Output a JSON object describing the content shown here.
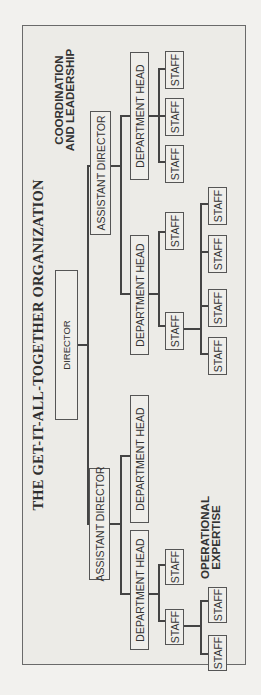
{
  "chart": {
    "title": "THE GET-IT-ALL-TOGETHER ORGANIZATION",
    "director": "DIRECTOR",
    "left_branch": {
      "assistant_director": "ASSISTANT DIRECTOR",
      "department_heads": [
        "DEPARTMENT HEAD",
        "DEPARTMENT HEAD"
      ],
      "staff": [
        "STAFF",
        "STAFF",
        "STAFF",
        "STAFF"
      ],
      "annotation_line1": "OPERATIONAL",
      "annotation_line2": "EXPERTISE"
    },
    "right_branch": {
      "assistant_director": "ASSISTANT DIRECTOR",
      "department_heads": [
        "DEPARTMENT HEAD",
        "DEPARTMENT HEAD"
      ],
      "staff_under_head_1": [
        "STAFF",
        "STAFF",
        "STAFF",
        "STAFF",
        "STAFF",
        "STAFF"
      ],
      "staff_under_head_2": [
        "STAFF",
        "STAFF",
        "STAFF"
      ],
      "annotation_line1": "COORDINATION",
      "annotation_line2": "AND LEADERSHIP"
    }
  }
}
